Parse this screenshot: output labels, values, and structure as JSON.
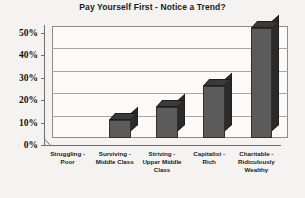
{
  "chart_data": {
    "type": "bar",
    "title": "Pay Yourself First - Notice a Trend?",
    "xlabel": "",
    "ylabel": "",
    "ylim": [
      0,
      50
    ],
    "ytick_labels": [
      "50%",
      "40%",
      "30%",
      "20%",
      "10%",
      "0%"
    ],
    "ytick_values": [
      50,
      40,
      30,
      20,
      10,
      0
    ],
    "grid": true,
    "legend": "none",
    "three_d": true,
    "bar_color": "#5b5b5b",
    "categories": [
      "Struggling -\nPoor",
      "Surviving -\nMiddle Class",
      "Striving -\nUpper Middle\nClass",
      "Capitalist -\nRich",
      "Charitable -\nRidiculously\nWealthy"
    ],
    "category_lines": [
      [
        "Struggling -",
        "Poor"
      ],
      [
        "Surviving -",
        "Middle Class"
      ],
      [
        "Striving -",
        "Upper Middle",
        "Class"
      ],
      [
        "Capitalist -",
        "Rich"
      ],
      [
        "Charitable -",
        "Ridiculously",
        "Wealthy"
      ]
    ],
    "values": [
      0,
      8,
      14,
      23,
      49
    ]
  }
}
